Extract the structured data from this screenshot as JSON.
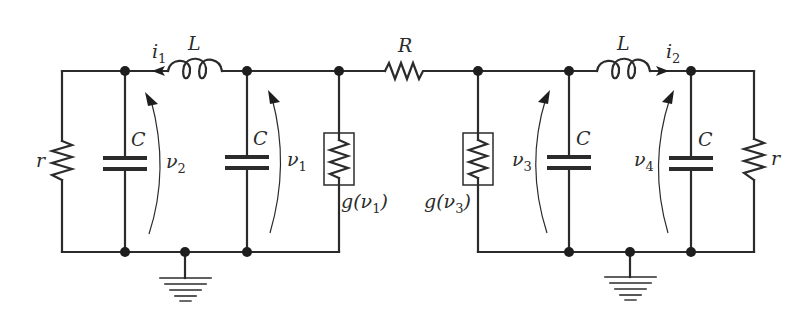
{
  "figure": {
    "type": "circuit schematic"
  },
  "labels": {
    "L_left": "L",
    "L_right": "L",
    "R": "R",
    "r_left": "r",
    "r_right": "r",
    "C_1": "C",
    "C_2": "C",
    "C_3": "C",
    "C_4": "C",
    "i1_main": "i",
    "i1_sub": "1",
    "i2_main": "i",
    "i2_sub": "2",
    "v1_main": "ν",
    "v1_sub": "1",
    "v2_main": "ν",
    "v2_sub": "2",
    "v3_main": "ν",
    "v3_sub": "3",
    "v4_main": "ν",
    "v4_sub": "4",
    "g1_pre": "g(ν",
    "g1_sub": "1",
    "g1_post": ")",
    "g3_pre": "g(ν",
    "g3_sub": "3",
    "g3_post": ")"
  },
  "components": [
    {
      "id": "r-left",
      "type": "resistor",
      "label": "r"
    },
    {
      "id": "C-v2",
      "type": "capacitor",
      "label": "C",
      "voltage": "v2"
    },
    {
      "id": "L-left",
      "type": "inductor",
      "label": "L",
      "current": "i1"
    },
    {
      "id": "C-v1",
      "type": "capacitor",
      "label": "C",
      "voltage": "v1"
    },
    {
      "id": "g-v1",
      "type": "nonlinear-conductance",
      "label": "g(v1)"
    },
    {
      "id": "R-coupling",
      "type": "resistor",
      "label": "R"
    },
    {
      "id": "g-v3",
      "type": "nonlinear-conductance",
      "label": "g(v3)"
    },
    {
      "id": "C-v3",
      "type": "capacitor",
      "label": "C",
      "voltage": "v3"
    },
    {
      "id": "L-right",
      "type": "inductor",
      "label": "L",
      "current": "i2"
    },
    {
      "id": "C-v4",
      "type": "capacitor",
      "label": "C",
      "voltage": "v4"
    },
    {
      "id": "r-right",
      "type": "resistor",
      "label": "r"
    },
    {
      "id": "ground-left",
      "type": "ground"
    },
    {
      "id": "ground-right",
      "type": "ground"
    }
  ]
}
